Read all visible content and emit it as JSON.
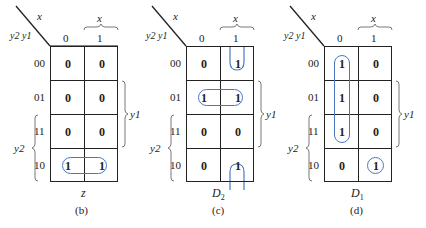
{
  "colors": {
    "grid": "#222222",
    "loop": "#4a78c0",
    "text": "#222222"
  },
  "axis": {
    "col_var": "x",
    "row_var": "y2 y1",
    "col_labels": [
      "0",
      "1"
    ],
    "row_labels": [
      "00",
      "01",
      "11",
      "10"
    ],
    "x_brace_label": "x",
    "y1_brace_label": "y1",
    "y2_brace_label": "y2"
  },
  "maps": [
    {
      "id": "b",
      "function_name": "z",
      "function_sub": "",
      "caption": "(b)",
      "cells": [
        [
          "0",
          "0"
        ],
        [
          "0",
          "0"
        ],
        [
          "0",
          "0"
        ],
        [
          "1",
          "1"
        ]
      ],
      "groupings": [
        "row 10 (both columns) horizontal loop"
      ]
    },
    {
      "id": "c",
      "function_name": "D",
      "function_sub": "2",
      "caption": "(c)",
      "cells": [
        [
          "0",
          "1"
        ],
        [
          "1",
          "1"
        ],
        [
          "0",
          "0"
        ],
        [
          "0",
          "1"
        ]
      ],
      "groupings": [
        "row 01 horizontal loop",
        "column 1 wrap-around loop rows 00 & 10"
      ]
    },
    {
      "id": "d",
      "function_name": "D",
      "function_sub": "1",
      "caption": "(d)",
      "cells": [
        [
          "1",
          "0"
        ],
        [
          "1",
          "0"
        ],
        [
          "1",
          "0"
        ],
        [
          "0",
          "1"
        ]
      ],
      "groupings": [
        "column 0 vertical loop rows 00-11",
        "single cell loop row 10 column 1"
      ]
    }
  ]
}
